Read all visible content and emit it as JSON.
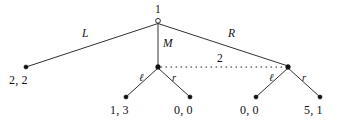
{
  "figure": {
    "kind": "extensive-form-game-tree",
    "background_color": "#ffffff",
    "line_color": "#1a1a1a",
    "node_fill_color": "#111111"
  },
  "nodes": {
    "root": {
      "player_label": "1",
      "style": "hollow-circle",
      "x": 158,
      "y": 20.5
    },
    "player2_left": {
      "style": "filled-dot",
      "x": 158,
      "y": 67
    },
    "player2_right": {
      "style": "filled-dot",
      "x": 288,
      "y": 67
    }
  },
  "information_set": {
    "label": "2",
    "style": "dotted",
    "from_x": 160,
    "to_x": 286,
    "y": 67,
    "label_x": 220,
    "label_y": 53
  },
  "edges": [
    {
      "id": "root-L",
      "action_label": "L",
      "from": "root",
      "to": "terminal_22",
      "label_x": 82,
      "label_y": 28
    },
    {
      "id": "root-M",
      "action_label": "M",
      "from": "root",
      "to": "player2_left",
      "label_x": 163,
      "label_y": 38
    },
    {
      "id": "root-R",
      "action_label": "R",
      "from": "root",
      "to": "player2_right",
      "label_x": 228,
      "label_y": 28
    },
    {
      "id": "left-l",
      "action_label": "ℓ",
      "from": "player2_left",
      "to": "terminal_13",
      "label_x": 139,
      "label_y": 73
    },
    {
      "id": "left-r",
      "action_label": "r",
      "from": "player2_left",
      "to": "terminal_00a",
      "label_x": 172,
      "label_y": 73
    },
    {
      "id": "right-l",
      "action_label": "ℓ",
      "from": "player2_right",
      "to": "terminal_00b",
      "label_x": 269,
      "label_y": 73
    },
    {
      "id": "right-r",
      "action_label": "r",
      "from": "player2_right",
      "to": "terminal_51",
      "label_x": 302,
      "label_y": 73
    }
  ],
  "terminals": [
    {
      "id": "terminal_22",
      "payoff": "2, 2",
      "dot_x": 26,
      "dot_y": 67,
      "label_x": 26,
      "label_y": 80
    },
    {
      "id": "terminal_13",
      "payoff": "1, 3",
      "dot_x": 126,
      "dot_y": 97,
      "label_x": 126,
      "label_y": 110
    },
    {
      "id": "terminal_00a",
      "payoff": "0, 0",
      "dot_x": 190,
      "dot_y": 97,
      "label_x": 190,
      "label_y": 110
    },
    {
      "id": "terminal_00b",
      "payoff": "0, 0",
      "dot_x": 256,
      "dot_y": 97,
      "label_x": 256,
      "label_y": 110
    },
    {
      "id": "terminal_51",
      "payoff": "5, 1",
      "dot_x": 320,
      "dot_y": 97,
      "label_x": 320,
      "label_y": 110
    }
  ]
}
